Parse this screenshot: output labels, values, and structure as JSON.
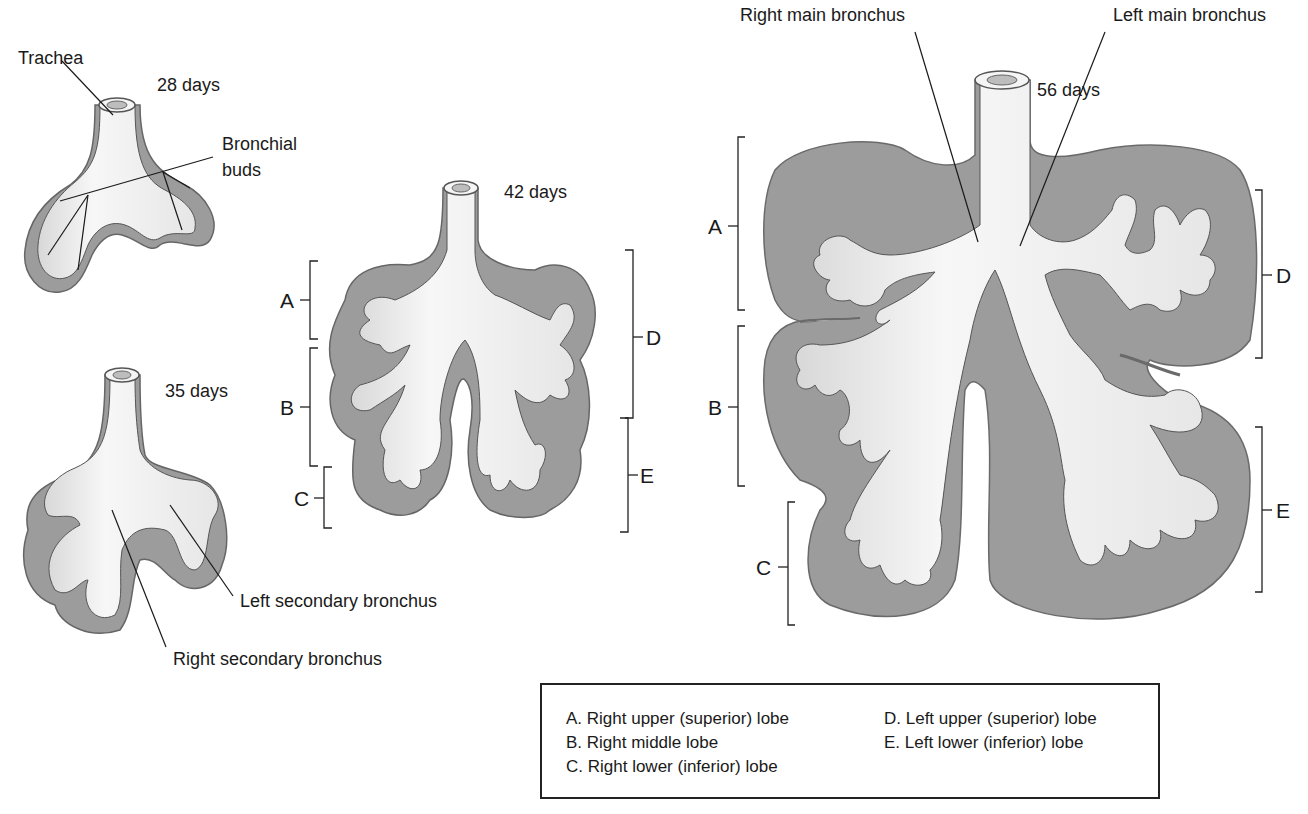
{
  "figure": {
    "stages": [
      {
        "id": "28d",
        "label": "28 days"
      },
      {
        "id": "35d",
        "label": "35 days"
      },
      {
        "id": "42d",
        "label": "42 days"
      },
      {
        "id": "56d",
        "label": "56 days"
      }
    ],
    "annotations": {
      "trachea": "Trachea",
      "bronchial_buds_1": "Bronchial",
      "bronchial_buds_2": "buds",
      "left_secondary": "Left secondary bronchus",
      "right_secondary": "Right secondary bronchus",
      "right_main": "Right main bronchus",
      "left_main": "Left main bronchus"
    },
    "lobe_letters": [
      "A",
      "B",
      "C",
      "D",
      "E"
    ],
    "legend": {
      "left": [
        "A.  Right upper (superior) lobe",
        "B.  Right middle lobe",
        "C.  Right lower (inferior) lobe"
      ],
      "right": [
        "D.  Left upper (superior) lobe",
        "E.  Left lower (inferior) lobe"
      ]
    },
    "colors": {
      "mesenchyme": "#9a9a9a",
      "mesenchyme_edge": "#6e6e6e",
      "epithelium": "#f2f2f2",
      "shadow": "#7a7a7a",
      "line": "#1a1a1a"
    }
  }
}
